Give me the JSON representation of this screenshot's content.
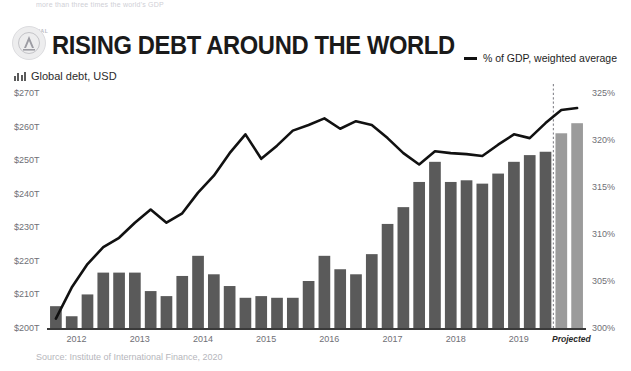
{
  "page": {
    "cropped_top_text": "more than three times the world's GDP",
    "brand": "SIGNAL",
    "title": "RISING DEBT AROUND THE WORLD",
    "subtitle": "Global debt, USD",
    "source": "Source: Institute of International Finance, 2020",
    "projected_label": "Projected"
  },
  "legend": {
    "line_label": "% of GDP, weighted average",
    "line_color": "#111111"
  },
  "colors": {
    "bar": "#5a5a5a",
    "bar_projected": "#9b9b9b",
    "line": "#111111",
    "axis": "#3a3a3a",
    "tick_text": "#6f6f76"
  },
  "chart_data": {
    "type": "bar",
    "title": "RISING DEBT AROUND THE WORLD",
    "subtitle": "Global debt, USD",
    "xlabel": "",
    "ylabel": "Global debt, USD",
    "y2label": "% of GDP, weighted average",
    "ylim": [
      200,
      270
    ],
    "y2lim": [
      300,
      325
    ],
    "ytick_labels": [
      "$270T",
      "$260T",
      "$250T",
      "$240T",
      "$230T",
      "$220T",
      "$210T",
      "$200T"
    ],
    "ytick_values": [
      270,
      260,
      250,
      240,
      230,
      220,
      210,
      200
    ],
    "y2tick_labels": [
      "325%",
      "320%",
      "315%",
      "310%",
      "305%",
      "300%"
    ],
    "y2tick_values": [
      325,
      320,
      315,
      310,
      305,
      300
    ],
    "xtick_labels": [
      "2012",
      "2013",
      "2014",
      "2015",
      "2016",
      "2017",
      "2018",
      "2019"
    ],
    "grid": false,
    "legend_position": "top-right",
    "categories": [
      "2012 Q1",
      "2012 Q2",
      "2012 Q3",
      "2012 Q4",
      "2013 Q1",
      "2013 Q2",
      "2013 Q3",
      "2013 Q4",
      "2014 Q1",
      "2014 Q2",
      "2014 Q3",
      "2014 Q4",
      "2015 Q1",
      "2015 Q2",
      "2015 Q3",
      "2015 Q4",
      "2016 Q1",
      "2016 Q2",
      "2016 Q3",
      "2016 Q4",
      "2017 Q1",
      "2017 Q2",
      "2017 Q3",
      "2017 Q4",
      "2018 Q1",
      "2018 Q2",
      "2018 Q3",
      "2018 Q4",
      "2019 Q1",
      "2019 Q2",
      "2019 Q3",
      "2019 Q4",
      "2020 Q1",
      "2020 Q2"
    ],
    "series": [
      {
        "name": "Global debt, USD",
        "type": "bar",
        "axis": "left",
        "unit": "trillion USD",
        "values": [
          206.5,
          203.5,
          210.0,
          216.5,
          216.5,
          216.5,
          211.0,
          209.5,
          215.5,
          221.5,
          216.0,
          212.5,
          209.0,
          209.5,
          209.0,
          209.0,
          214.0,
          221.5,
          217.5,
          216.0,
          222.0,
          231.0,
          236.0,
          243.5,
          249.5,
          243.5,
          244.0,
          243.0,
          246.0,
          249.5,
          251.5,
          252.5,
          258.0,
          261.0
        ],
        "projected_from_index": 32
      },
      {
        "name": "% of GDP, weighted average",
        "type": "line",
        "axis": "right",
        "unit": "percent of GDP",
        "values": [
          301.0,
          304.3,
          306.8,
          308.6,
          309.6,
          311.2,
          312.6,
          311.2,
          312.2,
          314.4,
          316.2,
          318.6,
          320.6,
          318.0,
          319.4,
          321.0,
          321.6,
          322.3,
          321.2,
          322.0,
          321.6,
          320.2,
          318.6,
          317.4,
          318.8,
          318.6,
          318.5,
          318.3,
          319.5,
          320.6,
          320.2,
          321.8,
          323.2,
          323.4
        ]
      }
    ]
  }
}
